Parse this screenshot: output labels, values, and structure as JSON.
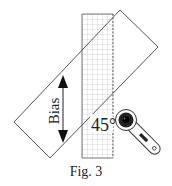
{
  "diagram": {
    "bias_label": "Bias",
    "angle_label": "45°",
    "caption": "Fig. 3",
    "elements": {
      "ruler": {
        "description": "grid ruler",
        "x": 82,
        "y": 14,
        "width": 31,
        "height": 144,
        "grid_cell": 5
      },
      "fabric_strip": {
        "description": "rotated rectangle (fabric) at 45°",
        "corners": [
          [
            120,
            10
          ],
          [
            158,
            47
          ],
          [
            50,
            158
          ],
          [
            14,
            122
          ]
        ]
      },
      "bias_arrow": {
        "description": "double-headed vertical arrow",
        "x": 63,
        "y1": 76,
        "y2": 142
      },
      "rotary_cutter": {
        "description": "rotary cutter tool",
        "head_center": [
          126,
          120
        ],
        "handle_end": [
          157,
          153
        ]
      }
    },
    "colors": {
      "line": "#555555",
      "grid": "#b5b5b5",
      "ink": "#222222",
      "background": "#ffffff"
    }
  }
}
